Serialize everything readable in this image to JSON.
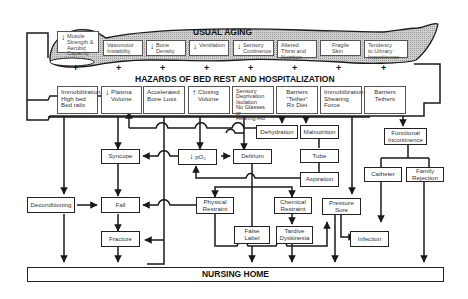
{
  "diagram": {
    "usual_aging": {
      "title": "USUAL AGING",
      "items": [
        {
          "label": "Muscle\nStrength &\nAerobic\nCapacity",
          "arrow": "down"
        },
        {
          "label": "Vasomotor\nInstability",
          "arrow": ""
        },
        {
          "label": "Bone\nDensity",
          "arrow": "down"
        },
        {
          "label": "Ventilation",
          "arrow": "down"
        },
        {
          "label": "Sensory\nContinence",
          "arrow": "down"
        },
        {
          "label": "Altered\nThirst and\nNutrition",
          "arrow": ""
        },
        {
          "label": "Fragile\nSkin",
          "arrow": ""
        },
        {
          "label": "Tendency\nto Urinary\nIncontinence",
          "arrow": ""
        }
      ]
    },
    "plus_sign": "+",
    "hazards": {
      "title": "HAZARDS OF BED REST AND HOSPITALIZATION",
      "items": [
        {
          "label": "Immobilization\nHigh bed\nBed rails",
          "arrow": ""
        },
        {
          "label": "Plasma\nVolume",
          "arrow": "down"
        },
        {
          "label": "Accelerated\nBone Loss",
          "arrow": ""
        },
        {
          "label": "Closing\nVolume",
          "arrow": "up"
        },
        {
          "label": "Sensory\nDeprivation\nIsolation\nNo Glasses or\nHearing Aid",
          "arrow": ""
        },
        {
          "label": "Barriers\n\"Tether\"\nRx Diet",
          "arrow": ""
        },
        {
          "label": "Immobilization\nShearing\nForce",
          "arrow": ""
        },
        {
          "label": "Barriers\nTethers",
          "arrow": ""
        }
      ]
    },
    "nodes": {
      "dehydration": "Dehydration",
      "malnutrition": "Malnutrition",
      "functional_incontinence": "Functional\nIncontinence",
      "syncope": "Syncope",
      "po2": "pO₂",
      "po2_arrow": "down",
      "delirium": "Delirium",
      "tube": "Tube",
      "aspiration": "Aspiration",
      "catheter": "Catheter",
      "family_rejection": "Family\nRejection",
      "deconditioning": "Deconditioning",
      "fall": "Fall",
      "physical_restraint": "Physical\nRestraint",
      "chemical_restraint": "Chemical\nRestraint",
      "pressure_sore": "Pressure\nSore",
      "fracture": "Fracture",
      "false_label": "False\nLabel",
      "tardive_dyskinesia": "Tardive\nDyskinesia",
      "infection": "Infection"
    },
    "outcome": {
      "title": "NURSING HOME"
    },
    "colors": {
      "line": "#1a1a1a",
      "body_fill": "#bdbdbd",
      "box_border": "#222222",
      "background": "#ffffff"
    }
  }
}
